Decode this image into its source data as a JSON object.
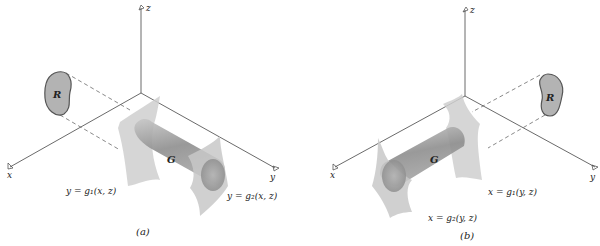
{
  "figures": [
    {
      "caption": "(a)",
      "axes": {
        "x": "x",
        "y": "y",
        "z": "z"
      },
      "region_label": "R",
      "solid_label": "G",
      "surface_lower": "y = g₁(x, z)",
      "surface_upper": "y = g₂(x, z)"
    },
    {
      "caption": "(b)",
      "axes": {
        "x": "x",
        "y": "y",
        "z": "z"
      },
      "region_label": "R",
      "solid_label": "G",
      "surface_lower": "x = g₁(y, z)",
      "surface_upper": "x = g₂(y, z)"
    }
  ],
  "colors": {
    "axis": "#444444",
    "surface": "#c8c8c8",
    "cylinder": "#9a9a9a",
    "region_fill": "#b0b0b0",
    "region_stroke": "#555555"
  }
}
